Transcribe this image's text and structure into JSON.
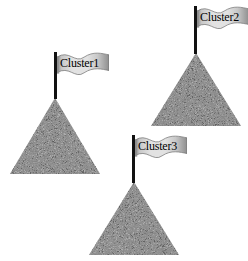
{
  "scene": {
    "title": "Cluster mountains diagram",
    "background_color": "#ffffff",
    "width": 248,
    "height": 261
  },
  "style": {
    "mountain_fill": "#808080",
    "mountain_noise_light": "#b4b4b4",
    "mountain_noise_dark": "#5a5a5a",
    "pole_color": "#111111",
    "banner_light": "#e2e2e2",
    "banner_mid": "#c8c8c8",
    "banner_dark": "#8e8e8e",
    "banner_edge": "#6e6e6e",
    "label_color": "#000000"
  },
  "clusters": [
    {
      "id": "cluster-1",
      "label": "Cluster1",
      "mountain": {
        "left": 10,
        "top": 98,
        "width": 90,
        "height": 76
      },
      "pole": {
        "left": 54,
        "top": 52,
        "height": 47
      },
      "banner": {
        "left": 57,
        "top": 52,
        "width": 52,
        "height": 26
      },
      "label_pos": {
        "left": 60,
        "top": 57
      }
    },
    {
      "id": "cluster-2",
      "label": "Cluster2",
      "mountain": {
        "left": 151,
        "top": 53,
        "width": 90,
        "height": 73
      },
      "pole": {
        "left": 194,
        "top": 6,
        "height": 48
      },
      "banner": {
        "left": 197,
        "top": 6,
        "width": 52,
        "height": 26
      },
      "label_pos": {
        "left": 200,
        "top": 11
      }
    },
    {
      "id": "cluster-3",
      "label": "Cluster3",
      "mountain": {
        "left": 89,
        "top": 182,
        "width": 90,
        "height": 73
      },
      "pole": {
        "left": 132,
        "top": 135,
        "height": 48
      },
      "banner": {
        "left": 135,
        "top": 135,
        "width": 52,
        "height": 26
      },
      "label_pos": {
        "left": 138,
        "top": 140
      }
    }
  ]
}
